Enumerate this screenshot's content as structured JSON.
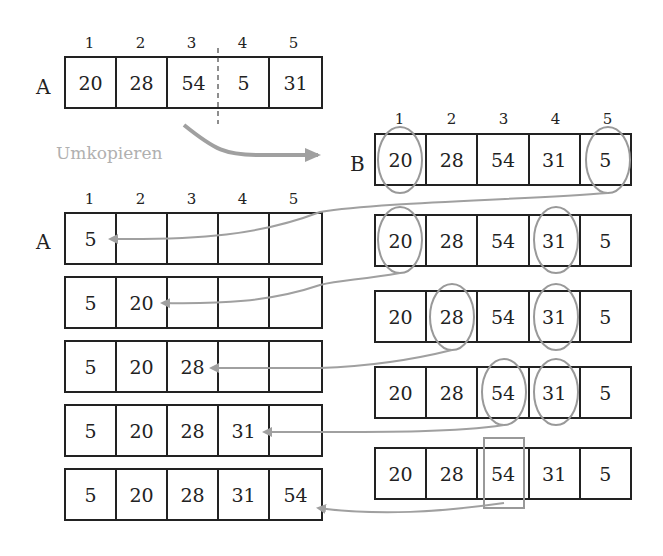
{
  "caption_label": "Umkopieren",
  "array_a_label": "A",
  "array_b_label": "B",
  "indices": [
    "1",
    "2",
    "3",
    "4",
    "5"
  ],
  "initial_a": [
    "20",
    "28",
    "54",
    "5",
    "31"
  ],
  "b_rows": [
    [
      "20",
      "28",
      "54",
      "31",
      "5"
    ],
    [
      "20",
      "28",
      "54",
      "31",
      "5"
    ],
    [
      "20",
      "28",
      "54",
      "31",
      "5"
    ],
    [
      "20",
      "28",
      "54",
      "31",
      "5"
    ],
    [
      "20",
      "28",
      "54",
      "31",
      "5"
    ]
  ],
  "a_rows": [
    [
      "5",
      "",
      "",
      "",
      ""
    ],
    [
      "5",
      "20",
      "",
      "",
      ""
    ],
    [
      "5",
      "20",
      "28",
      "",
      ""
    ],
    [
      "5",
      "20",
      "28",
      "31",
      ""
    ],
    [
      "5",
      "20",
      "28",
      "31",
      "54"
    ]
  ],
  "colors": {
    "line": "#222222",
    "highlight": "#999999",
    "arrow": "#a0a0a0",
    "caption": "#b0b0b0"
  }
}
